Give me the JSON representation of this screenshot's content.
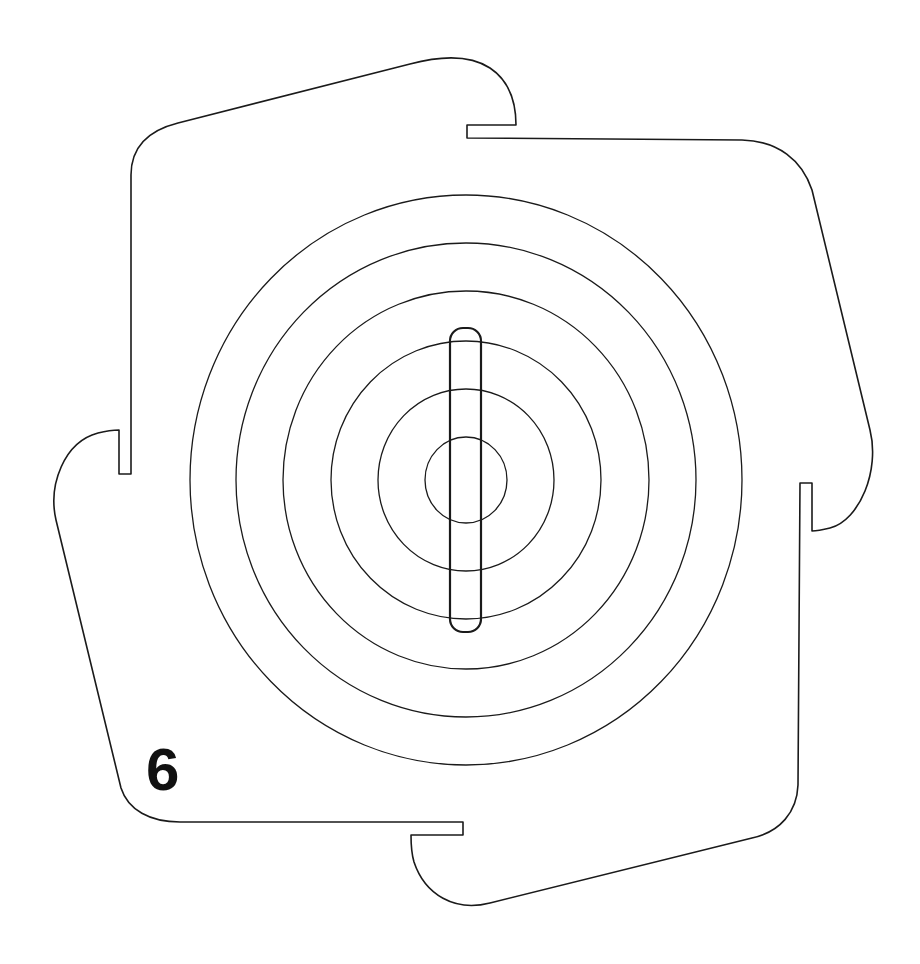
{
  "figure": {
    "label": "6",
    "stroke_color": "#1a1a1a",
    "background": "#ffffff"
  },
  "rings": {
    "center": [
      466,
      480
    ],
    "items": [
      {
        "rx": 276,
        "ry": 285
      },
      {
        "rx": 230,
        "ry": 237
      },
      {
        "rx": 183,
        "ry": 189
      },
      {
        "rx": 135,
        "ry": 139
      },
      {
        "rx": 88,
        "ry": 91
      },
      {
        "rx": 41,
        "ry": 43
      }
    ]
  },
  "slot": {
    "x": 450,
    "y": 328,
    "width": 31,
    "height": 304,
    "radius": 13
  }
}
